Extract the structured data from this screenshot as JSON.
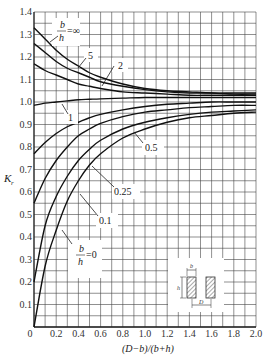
{
  "chart_data": {
    "type": "line",
    "title": "",
    "xlabel": "(D−b)/(b+h)",
    "ylabel": "Kr",
    "xlim": [
      0,
      2.0
    ],
    "ylim": [
      0,
      1.4
    ],
    "grid": true,
    "x_ticks": [
      "0",
      "0.2",
      "0.4",
      "0.6",
      "0.8",
      "1.0",
      "1.2",
      "1.4",
      "1.6",
      "1.8",
      "2.0"
    ],
    "y_ticks": [
      "0.1",
      "0.2",
      "0.3",
      "0.4",
      "0.5",
      "0.6",
      "0.7",
      "0.8",
      "0.9",
      "1.0",
      "1.1",
      "1.2",
      "1.3",
      "1.4"
    ],
    "x": [
      0,
      0.1,
      0.2,
      0.3,
      0.4,
      0.5,
      0.6,
      0.8,
      1.0,
      1.2,
      1.4,
      1.6,
      1.8,
      2.0
    ],
    "series": [
      {
        "name": "b/h = ∞",
        "label": "b/h=∞",
        "values": [
          1.33,
          1.28,
          1.23,
          1.19,
          1.16,
          1.13,
          1.11,
          1.08,
          1.06,
          1.05,
          1.045,
          1.04,
          1.04,
          1.04
        ]
      },
      {
        "name": "b/h = 5",
        "label": "5",
        "values": [
          1.26,
          1.22,
          1.18,
          1.15,
          1.13,
          1.11,
          1.09,
          1.07,
          1.055,
          1.045,
          1.04,
          1.04,
          1.035,
          1.035
        ]
      },
      {
        "name": "b/h = 2",
        "label": "2",
        "values": [
          1.17,
          1.14,
          1.12,
          1.1,
          1.08,
          1.07,
          1.06,
          1.045,
          1.04,
          1.035,
          1.03,
          1.03,
          1.03,
          1.03
        ]
      },
      {
        "name": "b/h = 1",
        "label": "1",
        "values": [
          0.985,
          0.995,
          1.0,
          1.005,
          1.01,
          1.012,
          1.014,
          1.017,
          1.02,
          1.02,
          1.02,
          1.02,
          1.02,
          1.02
        ]
      },
      {
        "name": "b/h = 0.5",
        "label": "0.5",
        "values": [
          0.77,
          0.82,
          0.86,
          0.89,
          0.91,
          0.93,
          0.945,
          0.965,
          0.98,
          0.99,
          0.995,
          1.0,
          1.0,
          1.0
        ]
      },
      {
        "name": "b/h = 0.25",
        "label": "0.25",
        "values": [
          0.55,
          0.66,
          0.74,
          0.8,
          0.85,
          0.88,
          0.905,
          0.935,
          0.955,
          0.965,
          0.975,
          0.98,
          0.985,
          0.985
        ]
      },
      {
        "name": "b/h = 0.1",
        "label": "0.1",
        "values": [
          0.2,
          0.45,
          0.58,
          0.67,
          0.74,
          0.79,
          0.83,
          0.88,
          0.91,
          0.93,
          0.945,
          0.955,
          0.96,
          0.965
        ]
      },
      {
        "name": "b/h = 0",
        "label": "b/h=0",
        "values": [
          0.0,
          0.27,
          0.43,
          0.56,
          0.65,
          0.72,
          0.77,
          0.84,
          0.88,
          0.91,
          0.93,
          0.94,
          0.95,
          0.955
        ]
      }
    ],
    "annotations": [
      "b/h = ∞",
      "5",
      "2",
      "1",
      "0.5",
      "0.25",
      "0.1",
      "b/h = 0"
    ],
    "inset": {
      "description": "two hatched rectangular conductors, width b, height h, spacing D",
      "labels": [
        "b",
        "h",
        "D"
      ]
    }
  },
  "labels": {
    "x_axis": "(D−b)/(b+h)",
    "y_axis_main": "K",
    "y_axis_sub": "r",
    "curve_inf_b": "b",
    "curve_inf_h": "h",
    "curve_inf_eq": "=∞",
    "curve_5": "5",
    "curve_2": "2",
    "curve_1": "1",
    "curve_05": "0.5",
    "curve_025": "0.25",
    "curve_01": "0.1",
    "curve_0_b": "b",
    "curve_0_h": "h",
    "curve_0_eq": "=0",
    "inset_b": "b",
    "inset_h": "h",
    "inset_D": "D"
  }
}
